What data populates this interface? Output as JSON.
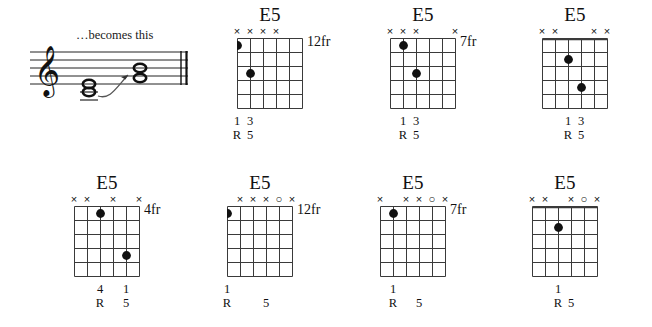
{
  "notation": {
    "caption": "…becomes this",
    "clef": "treble-clef",
    "staff_lines": 5,
    "notes_before": [
      "whole-note",
      "whole-note"
    ],
    "notes_after": [
      "whole-note",
      "whole-note"
    ],
    "arrow": "curved-arrow",
    "barline": "double-barline"
  },
  "chords": [
    {
      "name": "E5",
      "fret_label": "12fr",
      "nut": false,
      "strings": 6,
      "frets": 5,
      "markers": [
        "",
        "",
        "x",
        "x",
        "x",
        "x"
      ],
      "dots": [
        {
          "string": 6,
          "fret": 1
        },
        {
          "string": 5,
          "fret": 3
        }
      ],
      "fingers": [
        {
          "string": 6,
          "text": "1"
        },
        {
          "string": 5,
          "text": "3"
        }
      ],
      "intervals": [
        {
          "string": 6,
          "text": "R"
        },
        {
          "string": 5,
          "text": "5"
        }
      ]
    },
    {
      "name": "E5",
      "fret_label": "7fr",
      "nut": false,
      "strings": 6,
      "frets": 5,
      "markers": [
        "x",
        "",
        "",
        "x",
        "x",
        "x"
      ],
      "dots": [
        {
          "string": 5,
          "fret": 1
        },
        {
          "string": 4,
          "fret": 3
        }
      ],
      "fingers": [
        {
          "string": 5,
          "text": "1"
        },
        {
          "string": 4,
          "text": "3"
        }
      ],
      "intervals": [
        {
          "string": 5,
          "text": "R"
        },
        {
          "string": 4,
          "text": "5"
        }
      ]
    },
    {
      "name": "E5",
      "fret_label": "",
      "nut": true,
      "strings": 6,
      "frets": 5,
      "markers": [
        "x",
        "x",
        "",
        "",
        "x",
        "x"
      ],
      "dots": [
        {
          "string": 4,
          "fret": 2
        },
        {
          "string": 3,
          "fret": 4
        }
      ],
      "fingers": [
        {
          "string": 4,
          "text": "1"
        },
        {
          "string": 3,
          "text": "3"
        }
      ],
      "intervals": [
        {
          "string": 4,
          "text": "R"
        },
        {
          "string": 3,
          "text": "5"
        }
      ]
    },
    {
      "name": "E5",
      "fret_label": "4fr",
      "nut": false,
      "strings": 6,
      "frets": 5,
      "markers": [
        "x",
        "",
        "x",
        "",
        "x",
        "x"
      ],
      "dots": [
        {
          "string": 4,
          "fret": 1
        },
        {
          "string": 2,
          "fret": 4
        }
      ],
      "fingers": [
        {
          "string": 4,
          "text": "4"
        },
        {
          "string": 2,
          "text": "1"
        }
      ],
      "intervals": [
        {
          "string": 4,
          "text": "R"
        },
        {
          "string": 2,
          "text": "5"
        }
      ]
    },
    {
      "name": "E5",
      "fret_label": "12fr",
      "nut": false,
      "strings": 6,
      "frets": 5,
      "markers": [
        "x",
        "o",
        "x",
        "x",
        "x",
        ""
      ],
      "dots": [
        {
          "string": 6,
          "fret": 1
        }
      ],
      "fingers": [
        {
          "string": 6,
          "text": "1"
        }
      ],
      "intervals": [
        {
          "string": 6,
          "text": "R"
        },
        {
          "string": 3,
          "text": "5"
        }
      ]
    },
    {
      "name": "E5",
      "fret_label": "7fr",
      "nut": false,
      "strings": 6,
      "frets": 5,
      "markers": [
        "x",
        "o",
        "x",
        "x",
        "",
        "x"
      ],
      "dots": [
        {
          "string": 5,
          "fret": 1
        }
      ],
      "fingers": [
        {
          "string": 5,
          "text": "1"
        }
      ],
      "intervals": [
        {
          "string": 5,
          "text": "R"
        },
        {
          "string": 3,
          "text": "5"
        }
      ]
    },
    {
      "name": "E5",
      "fret_label": "",
      "nut": true,
      "strings": 6,
      "frets": 5,
      "markers": [
        "x",
        "o",
        "x",
        "",
        "x",
        "x"
      ],
      "dots": [
        {
          "string": 4,
          "fret": 2
        }
      ],
      "fingers": [
        {
          "string": 4,
          "text": "1"
        }
      ],
      "intervals": [
        {
          "string": 4,
          "text": "R"
        },
        {
          "string": 3,
          "text": "5"
        }
      ]
    }
  ],
  "layout": {
    "row_tops": [
      0,
      168
    ],
    "top_row_lefts": [
      225,
      378,
      530
    ],
    "bottom_row_lefts": [
      62,
      215,
      368,
      520
    ]
  },
  "colors": {
    "ink": "#111111",
    "grid": "#3a3a3a",
    "background": "#ffffff"
  }
}
